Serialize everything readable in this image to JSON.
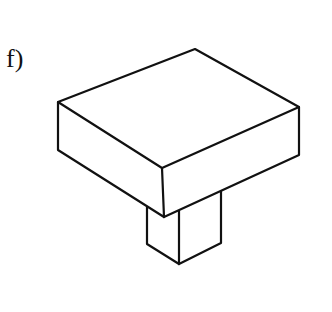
{
  "figure": {
    "label": "f)",
    "stroke_color": "#111111"
  }
}
